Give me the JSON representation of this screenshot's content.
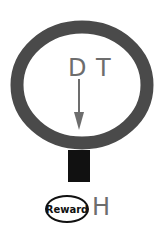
{
  "diagram": {
    "labels": {
      "d": "D",
      "t": "T",
      "h": "H",
      "reward": "Reward"
    },
    "colors": {
      "ring": "#4a4a4a",
      "stem": "#111111",
      "arrow": "#6d6d6d",
      "text": "#6d6d6d"
    }
  }
}
